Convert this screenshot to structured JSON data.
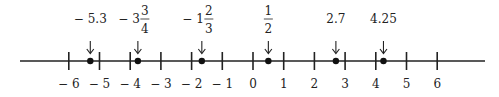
{
  "figure": {
    "axis": {
      "min": -6,
      "max": 6,
      "ticks": [
        -6,
        -5,
        -4,
        -3,
        -2,
        -1,
        0,
        1,
        2,
        3,
        4,
        5,
        6
      ],
      "tick_labels": [
        "− 6",
        "− 5",
        "− 4",
        "− 3",
        "− 2",
        "− 1",
        "0",
        "1",
        "2",
        "3",
        "4",
        "5",
        "6"
      ]
    },
    "points": [
      {
        "value": -5.3,
        "label": "− 5.3",
        "type": "decimal"
      },
      {
        "value": -3.75,
        "label_whole": "− 3",
        "label_num": "3",
        "label_den": "4",
        "type": "mixed"
      },
      {
        "value": -1.6667,
        "label_whole": "− 1",
        "label_num": "2",
        "label_den": "3",
        "type": "mixed"
      },
      {
        "value": 0.5,
        "label_num": "1",
        "label_den": "2",
        "type": "fraction"
      },
      {
        "value": 2.7,
        "label": "2.7",
        "type": "decimal"
      },
      {
        "value": 4.25,
        "label": "4.25",
        "type": "decimal"
      }
    ],
    "colors": {
      "line": "#222222",
      "point": "#111111",
      "text": "#222222"
    }
  }
}
